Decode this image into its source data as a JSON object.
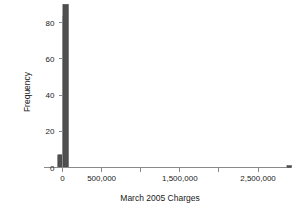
{
  "chart_data": {
    "type": "bar",
    "title": "",
    "subtitle": "",
    "xlabel": "March 2005 Charges",
    "ylabel": "Frequency",
    "xlim": [
      -150000,
      3200000
    ],
    "ylim": [
      0,
      92
    ],
    "grid": false,
    "legend": null,
    "x_ticks": [
      {
        "value": 0,
        "label": "0",
        "major": true
      },
      {
        "value": 500000,
        "label": "500,000",
        "major": true
      },
      {
        "value": 1000000,
        "label": "",
        "major": false
      },
      {
        "value": 1500000,
        "label": "1,500,000",
        "major": true
      },
      {
        "value": 2000000,
        "label": "",
        "major": false
      },
      {
        "value": 2500000,
        "label": "2,500,000",
        "major": true
      },
      {
        "value": 3000000,
        "label": "",
        "major": false
      }
    ],
    "y_ticks": [
      {
        "value": 0,
        "label": "0"
      },
      {
        "value": 20,
        "label": "20"
      },
      {
        "value": 40,
        "label": "40"
      },
      {
        "value": 60,
        "label": "60"
      },
      {
        "value": 80,
        "label": "80"
      }
    ],
    "bars": [
      {
        "x_center": -30000,
        "width": 60000,
        "value": 7
      },
      {
        "x_center": 40000,
        "width": 70000,
        "value": 90
      },
      {
        "x_center": 2900000,
        "width": 60000,
        "value": 1
      }
    ],
    "bar_color": "#4f4f4f",
    "axis_color": "#8a8a8a",
    "text_color": "#1a1a1a",
    "background_color": "#ffffff"
  }
}
